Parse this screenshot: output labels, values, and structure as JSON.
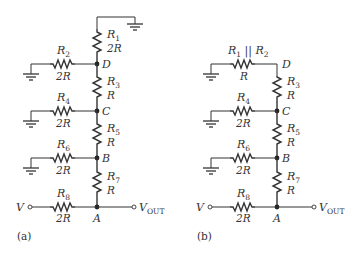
{
  "diagrams": [
    {
      "caption": "(a)",
      "resistors": [
        {
          "name": "R",
          "sub": "1",
          "value": "2R"
        },
        {
          "name": "R",
          "sub": "2",
          "value": "2R"
        },
        {
          "name": "R",
          "sub": "3",
          "value": "R"
        },
        {
          "name": "R",
          "sub": "4",
          "value": "2R"
        },
        {
          "name": "R",
          "sub": "5",
          "value": "R"
        },
        {
          "name": "R",
          "sub": "6",
          "value": "2R"
        },
        {
          "name": "R",
          "sub": "7",
          "value": "R"
        },
        {
          "name": "R",
          "sub": "8",
          "value": "2R"
        }
      ],
      "nodes": [
        "D",
        "C",
        "B",
        "A"
      ],
      "input_label": "V",
      "output_label": "V",
      "output_sub": "OUT"
    },
    {
      "caption": "(b)",
      "combined": {
        "label_a": "R",
        "sub_a": "1",
        "sep": " || ",
        "label_b": "R",
        "sub_b": "2",
        "value": "R"
      },
      "resistors": [
        {
          "name": "R",
          "sub": "3",
          "value": "R"
        },
        {
          "name": "R",
          "sub": "4",
          "value": "2R"
        },
        {
          "name": "R",
          "sub": "5",
          "value": "R"
        },
        {
          "name": "R",
          "sub": "6",
          "value": "2R"
        },
        {
          "name": "R",
          "sub": "7",
          "value": "R"
        },
        {
          "name": "R",
          "sub": "8",
          "value": "2R"
        }
      ],
      "nodes": [
        "D",
        "C",
        "B",
        "A"
      ],
      "input_label": "V",
      "output_label": "V",
      "output_sub": "OUT"
    }
  ]
}
